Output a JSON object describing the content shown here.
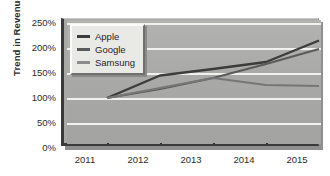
{
  "chart_data": {
    "type": "line",
    "title": "",
    "xlabel": "",
    "ylabel": "Trend in Revenue",
    "categories": [
      "2011",
      "2012",
      "2013",
      "2014",
      "2015"
    ],
    "ylim": [
      0,
      250
    ],
    "ytick_labels": [
      "0%",
      "50%",
      "100%",
      "150%",
      "200%",
      "250%"
    ],
    "ytick_values": [
      0,
      50,
      100,
      150,
      200,
      250
    ],
    "grid": true,
    "legend_position": "top-left",
    "series": [
      {
        "name": "Apple",
        "color": "#3c3c3c",
        "values": [
          100,
          145,
          158,
          172,
          215
        ]
      },
      {
        "name": "Google",
        "color": "#5a5a5a",
        "values": [
          100,
          118,
          140,
          168,
          198
        ]
      },
      {
        "name": "Samsung",
        "color": "#767676",
        "values": [
          100,
          120,
          140,
          126,
          124
        ]
      }
    ]
  },
  "axis": {
    "y_title": "Trend in Revenue",
    "y_labels": [
      "250%",
      "200%",
      "150%",
      "100%",
      "50%",
      "0%"
    ],
    "x_labels": [
      "2011",
      "2012",
      "2013",
      "2014",
      "2015"
    ]
  },
  "legend": {
    "items": [
      {
        "label": "Apple"
      },
      {
        "label": "Google"
      },
      {
        "label": "Samsung"
      }
    ]
  },
  "colors": {
    "plot_background": "#a8a8a6",
    "gridline": "#f1f1ee",
    "axis": "#3a3a3a",
    "series_apple": "#3c3c3c",
    "series_google": "#5a5a5a",
    "series_samsung": "#767676"
  }
}
